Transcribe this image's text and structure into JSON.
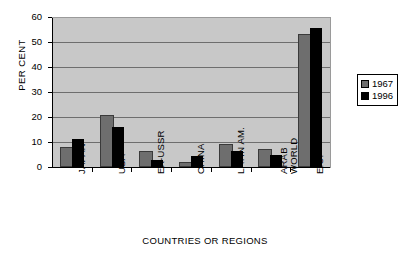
{
  "chart_data": {
    "type": "bar",
    "title": "",
    "xlabel": "COUNTRIES OR REGIONS",
    "ylabel": "PER CENT",
    "ylim": [
      0,
      60
    ],
    "yticks": [
      0,
      10,
      20,
      30,
      40,
      50,
      60
    ],
    "grid": true,
    "legend_position": "right",
    "categories": [
      "JAPAN",
      "USA",
      "EX-USSR",
      "CHINA",
      "LATIN AM.",
      "ARAB WORLD",
      "E.U."
    ],
    "series": [
      {
        "name": "1967",
        "color": "#6e6e6e",
        "values": [
          7.1,
          20.0,
          5.6,
          1.3,
          8.3,
          6.3,
          52.5
        ]
      },
      {
        "name": "1996",
        "color": "#000000",
        "values": [
          11.4,
          15.9,
          2.7,
          4.5,
          6.6,
          4.9,
          55.8
        ]
      }
    ]
  },
  "axis": {
    "y_title": "PER CENT",
    "x_title": "COUNTRIES OR REGIONS",
    "y_ticks": [
      "60",
      "50",
      "40",
      "30",
      "20",
      "10",
      "0"
    ]
  },
  "categories": [
    {
      "line1": "JAPAN",
      "line2": ""
    },
    {
      "line1": "USA",
      "line2": ""
    },
    {
      "line1": "EX-USSR",
      "line2": ""
    },
    {
      "line1": "CHINA",
      "line2": ""
    },
    {
      "line1": "LATIN AM.",
      "line2": ""
    },
    {
      "line1": "ARAB",
      "line2": "WORLD"
    },
    {
      "line1": "E.U.",
      "line2": ""
    }
  ],
  "legend": {
    "items": [
      {
        "label": "1967",
        "color": "#6e6e6e"
      },
      {
        "label": "1996",
        "color": "#000000"
      }
    ]
  },
  "colors": {
    "plot_background": "#c8c8c8",
    "gridline": "#6e6e6e",
    "axis": "#000000",
    "series_1967": "#6e6e6e",
    "series_1996": "#000000",
    "page_background": "#ffffff"
  }
}
